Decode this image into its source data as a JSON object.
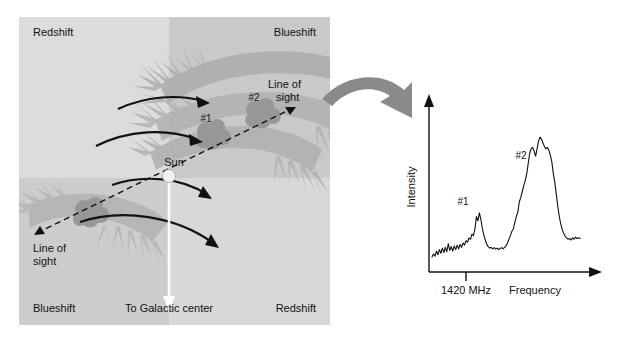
{
  "figure": {
    "colors": {
      "quadrant_light": "#dcdcdc",
      "quadrant_mid": "#d2d2d2",
      "quadrant_dark": "#c6c6c6",
      "spiral_arm": "#aeaeae",
      "cloud": "#9a9a9a",
      "big_arrow": "#8a8a8a",
      "sun": "#ffffff",
      "stroke": "#111111",
      "background": "#ffffff"
    }
  },
  "galaxy_panel": {
    "quadrant_labels": {
      "top_left": "Redshift",
      "top_right": "Blueshift",
      "bottom_left": "Blueshift",
      "bottom_right": "Redshift"
    },
    "sun_label": "Sun",
    "galactic_center_label": "To Galactic center",
    "line_of_sight_upper": "Line of\nsight",
    "line_of_sight_upper_line1": "Line of",
    "line_of_sight_upper_line2": "sight",
    "line_of_sight_lower_line1": "Line of",
    "line_of_sight_lower_line2": "sight",
    "cloud_labels": [
      "#1",
      "#2"
    ],
    "cloud_1_label": "#1",
    "cloud_2_label": "#2",
    "rotation_arrows_count": 4,
    "spiral_arms_count": 4
  },
  "connector": {
    "arrow_name": "leads-to-arrow"
  },
  "spectrum_panel": {
    "y_axis_label": "Intensity",
    "x_axis_label": "Frequency",
    "tick_label": "1420 MHz",
    "peak_1_label": "#1",
    "peak_2_label": "#2"
  },
  "chart_data": {
    "type": "line",
    "title": "",
    "xlabel": "Frequency",
    "ylabel": "Intensity",
    "annotations": [
      {
        "text": "#1",
        "x": 0.255,
        "y": 0.42
      },
      {
        "text": "#2",
        "x": 0.575,
        "y": 0.8
      }
    ],
    "xticks": [
      {
        "value": 0.225,
        "label": "1420 MHz"
      }
    ],
    "grid": false,
    "legend": null,
    "axis_style": "arrow-ended L-axes",
    "x": [
      0.0,
      0.01,
      0.02,
      0.03,
      0.04,
      0.05,
      0.06,
      0.07,
      0.08,
      0.09,
      0.1,
      0.11,
      0.12,
      0.13,
      0.14,
      0.15,
      0.16,
      0.17,
      0.18,
      0.19,
      0.2,
      0.21,
      0.22,
      0.23,
      0.24,
      0.25,
      0.26,
      0.27,
      0.28,
      0.29,
      0.3,
      0.31,
      0.32,
      0.33,
      0.34,
      0.35,
      0.36,
      0.37,
      0.38,
      0.39,
      0.4,
      0.41,
      0.42,
      0.43,
      0.44,
      0.45,
      0.46,
      0.47,
      0.48,
      0.49,
      0.5,
      0.51,
      0.52,
      0.53,
      0.54,
      0.55,
      0.56,
      0.57,
      0.58,
      0.59,
      0.6,
      0.61,
      0.62,
      0.63,
      0.64,
      0.65,
      0.66,
      0.67,
      0.68,
      0.69,
      0.7,
      0.71,
      0.72,
      0.73,
      0.74,
      0.75,
      0.76,
      0.77,
      0.78,
      0.79,
      0.8,
      0.81,
      0.82,
      0.83,
      0.84,
      0.85,
      0.86,
      0.87,
      0.88,
      0.89,
      0.9,
      0.91,
      0.92,
      0.93,
      0.94,
      0.95,
      0.96,
      0.97,
      0.98,
      0.99,
      1.0
    ],
    "y": [
      0.055,
      0.075,
      0.06,
      0.095,
      0.07,
      0.105,
      0.08,
      0.115,
      0.085,
      0.12,
      0.09,
      0.145,
      0.1,
      0.125,
      0.095,
      0.13,
      0.105,
      0.135,
      0.11,
      0.14,
      0.12,
      0.15,
      0.135,
      0.165,
      0.155,
      0.185,
      0.175,
      0.21,
      0.2,
      0.245,
      0.33,
      0.3,
      0.355,
      0.31,
      0.25,
      0.205,
      0.17,
      0.14,
      0.125,
      0.115,
      0.12,
      0.11,
      0.118,
      0.108,
      0.115,
      0.105,
      0.112,
      0.118,
      0.11,
      0.12,
      0.13,
      0.15,
      0.175,
      0.2,
      0.23,
      0.245,
      0.29,
      0.33,
      0.36,
      0.43,
      0.46,
      0.5,
      0.54,
      0.575,
      0.62,
      0.69,
      0.76,
      0.79,
      0.8,
      0.775,
      0.74,
      0.79,
      0.845,
      0.87,
      0.855,
      0.83,
      0.805,
      0.79,
      0.8,
      0.78,
      0.745,
      0.7,
      0.62,
      0.56,
      0.48,
      0.4,
      0.33,
      0.28,
      0.24,
      0.215,
      0.195,
      0.185,
      0.175,
      0.18,
      0.17,
      0.185,
      0.175,
      0.19,
      0.18,
      0.185,
      0.18
    ]
  }
}
